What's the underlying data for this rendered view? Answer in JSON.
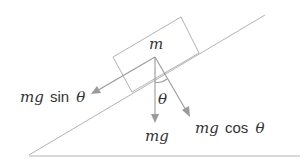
{
  "diagram": {
    "mass_label": "m",
    "labels": {
      "gravity": "mg",
      "parallel_component": "mg sin θ",
      "parallel_prefix": "mg",
      "parallel_fn": "sin",
      "perpendicular_component": "mg cos θ",
      "perpendicular_prefix": "mg",
      "perpendicular_fn": "cos",
      "angle": "θ"
    },
    "colors": {
      "lines": "#b3b3b3",
      "arrows": "#9a9a9a",
      "text": "#333333"
    }
  }
}
